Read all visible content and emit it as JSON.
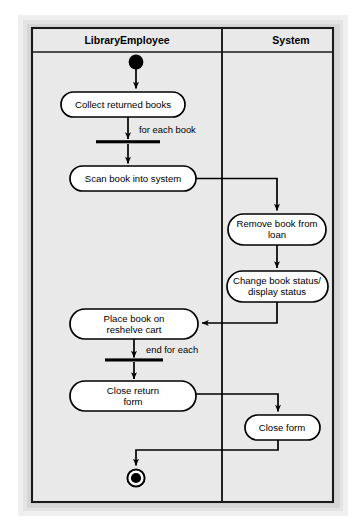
{
  "diagram": {
    "type": "uml-activity-diagram",
    "page_background": "#ffffff",
    "canvas_background": "#e8e8e8",
    "frame_border_color": "#1a1a1a",
    "node_fill": "#ffffff",
    "node_border": "#000000",
    "swimlanes": [
      {
        "id": "library-employee",
        "title": "LibraryEmployee",
        "x": 32,
        "width": 190
      },
      {
        "id": "system",
        "title": "System",
        "x": 222,
        "width": 111
      }
    ],
    "nodes": [
      {
        "id": "start",
        "kind": "initial-node",
        "lane": "library-employee",
        "label": "",
        "cx": 136,
        "cy": 62,
        "r": 7.5
      },
      {
        "id": "collect-returned-books",
        "kind": "activity",
        "lane": "library-employee",
        "label": "Collect returned books",
        "lines": [
          "Collect returned books"
        ],
        "x": 61,
        "y": 92,
        "w": 124,
        "h": 25
      },
      {
        "id": "fork-for-each",
        "kind": "bar",
        "lane": "library-employee",
        "label": "for each book",
        "x": 96,
        "y": 141,
        "w": 64,
        "h": 3
      },
      {
        "id": "scan-book-into-system",
        "kind": "activity",
        "lane": "library-employee",
        "label": "Scan book into system",
        "lines": [
          "Scan book into system"
        ],
        "x": 70,
        "y": 166,
        "w": 126,
        "h": 25
      },
      {
        "id": "remove-book-from-loan",
        "kind": "activity",
        "lane": "system",
        "label": "Remove book from loan",
        "lines": [
          "Remove book from",
          "loan"
        ],
        "x": 228,
        "y": 214,
        "w": 98,
        "h": 31
      },
      {
        "id": "change-book-status",
        "kind": "activity",
        "lane": "system",
        "label": "Change book status/ display status",
        "lines": [
          "Change book status/",
          "display status"
        ],
        "x": 227,
        "y": 271,
        "w": 101,
        "h": 31
      },
      {
        "id": "place-book-on-reshelve-cart",
        "kind": "activity",
        "lane": "library-employee",
        "label": "Place book on reshelve cart",
        "lines": [
          "Place book on",
          "reshelve cart"
        ],
        "x": 70,
        "y": 309,
        "w": 128,
        "h": 30
      },
      {
        "id": "join-end-for-each",
        "kind": "bar",
        "lane": "library-employee",
        "label": "end for each",
        "x": 105,
        "y": 359,
        "w": 58,
        "h": 3
      },
      {
        "id": "close-return-form",
        "kind": "activity",
        "lane": "library-employee",
        "label": "Close return form",
        "lines": [
          "Close return",
          "form"
        ],
        "x": 70,
        "y": 381,
        "w": 126,
        "h": 30
      },
      {
        "id": "close-form",
        "kind": "activity",
        "lane": "system",
        "label": "Close form",
        "lines": [
          "Close form"
        ],
        "x": 245,
        "y": 415,
        "w": 75,
        "h": 25
      },
      {
        "id": "final",
        "kind": "final-node",
        "lane": "library-employee",
        "label": "",
        "cx": 136,
        "cy": 478,
        "r_outer": 9,
        "r_inner": 5.2
      }
    ],
    "edges": [
      {
        "id": "start-to-collect",
        "from": "start",
        "to": "collect-returned-books",
        "label": ""
      },
      {
        "id": "collect-to-fork",
        "from": "collect-returned-books",
        "to": "fork-for-each",
        "label": "for each book"
      },
      {
        "id": "fork-to-scan",
        "from": "fork-for-each",
        "to": "scan-book-into-system",
        "label": ""
      },
      {
        "id": "scan-to-remove",
        "from": "scan-book-into-system",
        "to": "remove-book-from-loan",
        "label": ""
      },
      {
        "id": "remove-to-change",
        "from": "remove-book-from-loan",
        "to": "change-book-status",
        "label": ""
      },
      {
        "id": "change-to-place",
        "from": "change-book-status",
        "to": "place-book-on-reshelve-cart",
        "label": ""
      },
      {
        "id": "place-to-join",
        "from": "place-book-on-reshelve-cart",
        "to": "join-end-for-each",
        "label": "end for each"
      },
      {
        "id": "join-to-close-return",
        "from": "join-end-for-each",
        "to": "close-return-form",
        "label": ""
      },
      {
        "id": "close-return-to-close-form",
        "from": "close-return-form",
        "to": "close-form",
        "label": ""
      },
      {
        "id": "close-form-to-final",
        "from": "close-form",
        "to": "final",
        "label": ""
      }
    ],
    "edge_labels": {
      "for_each_book": "for each book",
      "end_for_each": "end for each"
    }
  }
}
